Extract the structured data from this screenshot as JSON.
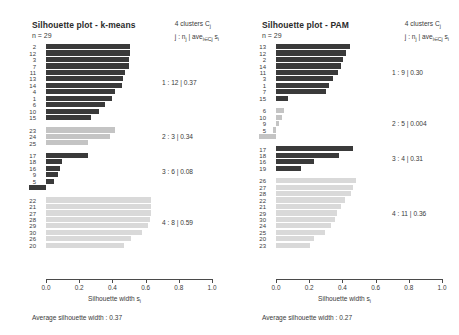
{
  "figure": {
    "width": 459,
    "height": 335,
    "background": "#ffffff"
  },
  "axis": {
    "ticks": [
      "0.0",
      "0.2",
      "0.4",
      "0.6",
      "0.8",
      "1.0"
    ],
    "tick_values": [
      0.0,
      0.2,
      0.4,
      0.6,
      0.8,
      1.0
    ],
    "xlabel_main": "Silhouette width s",
    "xlabel_sub": "i",
    "xmin": -0.12,
    "xmax": 1.0
  },
  "legend": {
    "line1": "4  clusters C",
    "line1_sub": "j",
    "line2_a": "j :  n",
    "line2_sub_a": "j",
    "line2_b": " | ave",
    "line2_sub_b": "i∈Cj",
    "line2_c": " s",
    "line2_sub_c": "i"
  },
  "panels": [
    {
      "id": "kmeans",
      "title": "Silhouette plot - k-means",
      "n_label": "n = 29",
      "avg_text": "Average silhouette width :  0.37",
      "avg_value": 0.37,
      "clusters": [
        {
          "index": 1,
          "annotation": "1 :   12  |  0.37",
          "size": 12,
          "avg": 0.37,
          "color": "#3a3a3a",
          "observations": [
            "2",
            "12",
            "3",
            "7",
            "11",
            "13",
            "14",
            "4",
            "1",
            "6",
            "10",
            "15"
          ],
          "values": [
            0.505,
            0.505,
            0.5,
            0.498,
            0.478,
            0.463,
            0.455,
            0.418,
            0.398,
            0.355,
            0.32,
            0.27
          ]
        },
        {
          "index": 2,
          "annotation": "2 :    3  |  0.34",
          "size": 3,
          "avg": 0.34,
          "color": "#c4c4c4",
          "observations": [
            "23",
            "24",
            "25"
          ],
          "values": [
            0.418,
            0.385,
            0.25
          ]
        },
        {
          "index": 3,
          "annotation": "3 :    6  |  0.08",
          "size": 6,
          "avg": 0.08,
          "color": "#3a3a3a",
          "observations": [
            "17",
            "18",
            "16",
            "9",
            "5",
            "19"
          ],
          "values": [
            0.25,
            0.098,
            0.085,
            0.073,
            0.048,
            -0.105
          ]
        },
        {
          "index": 4,
          "annotation": "4 :    8  |  0.59",
          "size": 8,
          "avg": 0.59,
          "color": "#d9d9d9",
          "observations": [
            "22",
            "21",
            "27",
            "28",
            "29",
            "30",
            "26",
            "20"
          ],
          "values": [
            0.635,
            0.633,
            0.63,
            0.625,
            0.612,
            0.578,
            0.51,
            0.47
          ]
        }
      ]
    },
    {
      "id": "pam",
      "title": "Silhouette plot - PAM",
      "n_label": "n = 29",
      "avg_text": "Average silhouette width :  0.27",
      "avg_value": 0.27,
      "clusters": [
        {
          "index": 1,
          "annotation": "1 :    9  |  0.30",
          "size": 9,
          "avg": 0.3,
          "color": "#3a3a3a",
          "observations": [
            "13",
            "12",
            "2",
            "14",
            "11",
            "3",
            "1",
            "7",
            "15"
          ],
          "values": [
            0.445,
            0.42,
            0.405,
            0.393,
            0.375,
            0.345,
            0.32,
            0.3,
            0.075
          ]
        },
        {
          "index": 2,
          "annotation": "2 :    5  |  0.004",
          "size": 5,
          "avg": 0.004,
          "color": "#c4c4c4",
          "observations": [
            "6",
            "10",
            "9",
            "5",
            "4"
          ],
          "values": [
            0.048,
            0.035,
            0.02,
            -0.018,
            -0.105
          ]
        },
        {
          "index": 3,
          "annotation": "3 :    4  |  0.31",
          "size": 4,
          "avg": 0.31,
          "color": "#3a3a3a",
          "observations": [
            "17",
            "18",
            "16",
            "19"
          ],
          "values": [
            0.465,
            0.378,
            0.228,
            0.148
          ]
        },
        {
          "index": 4,
          "annotation": "4 :   11  |  0.36",
          "size": 11,
          "avg": 0.36,
          "color": "#d9d9d9",
          "observations": [
            "26",
            "27",
            "28",
            "22",
            "21",
            "29",
            "30",
            "24",
            "25",
            "20",
            "23"
          ],
          "values": [
            0.48,
            0.463,
            0.45,
            0.418,
            0.39,
            0.368,
            0.358,
            0.33,
            0.295,
            0.23,
            0.205
          ]
        }
      ]
    }
  ],
  "chart_data": {
    "type": "bar",
    "xlabel": "Silhouette width s_i",
    "ylabel": "",
    "xlim": [
      -0.12,
      1.0
    ],
    "grid": false,
    "legend_position": "right",
    "orientation": "horizontal",
    "panels": [
      {
        "name": "Silhouette plot - k-means",
        "n": 29,
        "average_silhouette_width": 0.37,
        "categories": [
          "2",
          "12",
          "3",
          "7",
          "11",
          "13",
          "14",
          "4",
          "1",
          "6",
          "10",
          "15",
          "23",
          "24",
          "25",
          "17",
          "18",
          "16",
          "9",
          "5",
          "19",
          "22",
          "21",
          "27",
          "28",
          "29",
          "30",
          "26",
          "20"
        ],
        "values": [
          0.505,
          0.505,
          0.5,
          0.498,
          0.478,
          0.463,
          0.455,
          0.418,
          0.398,
          0.355,
          0.32,
          0.27,
          0.418,
          0.385,
          0.25,
          0.25,
          0.098,
          0.085,
          0.073,
          0.048,
          -0.105,
          0.635,
          0.633,
          0.63,
          0.625,
          0.612,
          0.578,
          0.51,
          0.47
        ],
        "cluster_of_point": [
          1,
          1,
          1,
          1,
          1,
          1,
          1,
          1,
          1,
          1,
          1,
          1,
          2,
          2,
          2,
          3,
          3,
          3,
          3,
          3,
          3,
          4,
          4,
          4,
          4,
          4,
          4,
          4,
          4
        ],
        "cluster_summary": [
          {
            "cluster": 1,
            "size": 12,
            "avg": 0.37
          },
          {
            "cluster": 2,
            "size": 3,
            "avg": 0.34
          },
          {
            "cluster": 3,
            "size": 6,
            "avg": 0.08
          },
          {
            "cluster": 4,
            "size": 8,
            "avg": 0.59
          }
        ]
      },
      {
        "name": "Silhouette plot - PAM",
        "n": 29,
        "average_silhouette_width": 0.27,
        "categories": [
          "13",
          "12",
          "2",
          "14",
          "11",
          "3",
          "1",
          "7",
          "15",
          "6",
          "10",
          "9",
          "5",
          "4",
          "17",
          "18",
          "16",
          "19",
          "26",
          "27",
          "28",
          "22",
          "21",
          "29",
          "30",
          "24",
          "25",
          "20",
          "23"
        ],
        "values": [
          0.445,
          0.42,
          0.405,
          0.393,
          0.375,
          0.345,
          0.32,
          0.3,
          0.075,
          0.048,
          0.035,
          0.02,
          -0.018,
          -0.105,
          0.465,
          0.378,
          0.228,
          0.148,
          0.48,
          0.463,
          0.45,
          0.418,
          0.39,
          0.368,
          0.358,
          0.33,
          0.295,
          0.23,
          0.205
        ],
        "cluster_of_point": [
          1,
          1,
          1,
          1,
          1,
          1,
          1,
          1,
          1,
          2,
          2,
          2,
          2,
          2,
          3,
          3,
          3,
          3,
          4,
          4,
          4,
          4,
          4,
          4,
          4,
          4,
          4,
          4,
          4
        ],
        "cluster_summary": [
          {
            "cluster": 1,
            "size": 9,
            "avg": 0.3
          },
          {
            "cluster": 2,
            "size": 5,
            "avg": 0.004
          },
          {
            "cluster": 3,
            "size": 4,
            "avg": 0.31
          },
          {
            "cluster": 4,
            "size": 11,
            "avg": 0.36
          }
        ]
      }
    ]
  }
}
